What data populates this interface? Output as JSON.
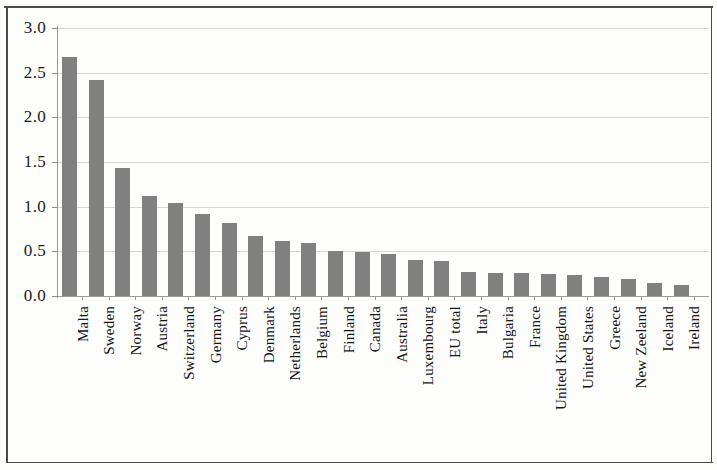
{
  "chart_data": {
    "type": "bar",
    "title": "",
    "subtitle": "",
    "xlabel": "",
    "ylabel": "",
    "ylim": [
      0.0,
      3.0
    ],
    "ytick_step": 0.5,
    "ytick_labels": [
      "0.0",
      "0.5",
      "1.0",
      "1.5",
      "2.0",
      "2.5",
      "3.0"
    ],
    "grid": "horizontal",
    "legend": "none",
    "bar_color": "#808080",
    "sorted": "descending",
    "categories": [
      "Malta",
      "Sweden",
      "Norway",
      "Austria",
      "Switzerland",
      "Germany",
      "Cyprus",
      "Denmark",
      "Netherlands",
      "Belgium",
      "Finland",
      "Canada",
      "Australia",
      "Luxembourg",
      "EU total",
      "Italy",
      "Bulgaria",
      "France",
      "United Kingdom",
      "United States",
      "Greece",
      "New Zeeland",
      "Iceland",
      "Ireland"
    ],
    "values": [
      2.67,
      2.42,
      1.43,
      1.12,
      1.04,
      0.92,
      0.82,
      0.67,
      0.62,
      0.59,
      0.5,
      0.49,
      0.47,
      0.4,
      0.39,
      0.27,
      0.26,
      0.26,
      0.25,
      0.24,
      0.21,
      0.19,
      0.15,
      0.12
    ]
  }
}
